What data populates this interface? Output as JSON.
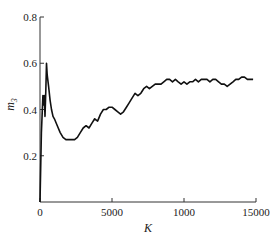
{
  "chart_data": {
    "type": "line",
    "title": "",
    "xlabel": "K",
    "ylabel": "m",
    "ylabel_subscript": "3",
    "xlim": [
      0,
      15000
    ],
    "ylim": [
      0,
      0.8
    ],
    "grid": false,
    "x_ticks": [
      0,
      5000,
      10000,
      15000
    ],
    "x_tick_labels": [
      "0",
      "5000",
      "1000",
      "15000"
    ],
    "y_ticks": [
      0.2,
      0.4,
      0.6,
      0.8
    ],
    "y_tick_labels": [
      "0.2",
      "0.4",
      "0.6",
      "0.8"
    ],
    "series": [
      {
        "name": "m3",
        "color": "#111111",
        "x": [
          0,
          100,
          200,
          250,
          300,
          350,
          400,
          450,
          500,
          600,
          700,
          800,
          900,
          1000,
          1200,
          1400,
          1600,
          1800,
          2000,
          2200,
          2400,
          2600,
          2800,
          3000,
          3200,
          3400,
          3600,
          3800,
          4000,
          4200,
          4400,
          4600,
          4800,
          5000,
          5200,
          5400,
          5600,
          5800,
          6000,
          6200,
          6400,
          6600,
          6800,
          7000,
          7200,
          7400,
          7600,
          7800,
          8000,
          8200,
          8400,
          8600,
          8800,
          9000,
          9200,
          9400,
          9600,
          9800,
          10000,
          10200,
          10400,
          10600,
          10800,
          11000,
          11200,
          11400,
          11600,
          11800,
          12000,
          12200,
          12400,
          12600,
          12800,
          13000,
          13200,
          13400,
          13600,
          13800,
          14000,
          14200,
          14400,
          14600,
          14800
        ],
        "y": [
          0.0,
          0.3,
          0.46,
          0.42,
          0.46,
          0.37,
          0.48,
          0.6,
          0.55,
          0.5,
          0.44,
          0.4,
          0.37,
          0.36,
          0.33,
          0.3,
          0.28,
          0.27,
          0.27,
          0.27,
          0.27,
          0.28,
          0.3,
          0.32,
          0.33,
          0.32,
          0.34,
          0.36,
          0.35,
          0.38,
          0.4,
          0.4,
          0.41,
          0.41,
          0.4,
          0.39,
          0.38,
          0.39,
          0.41,
          0.43,
          0.45,
          0.47,
          0.46,
          0.47,
          0.49,
          0.5,
          0.49,
          0.5,
          0.51,
          0.51,
          0.51,
          0.52,
          0.53,
          0.53,
          0.52,
          0.53,
          0.52,
          0.51,
          0.52,
          0.51,
          0.52,
          0.52,
          0.53,
          0.52,
          0.53,
          0.53,
          0.53,
          0.52,
          0.53,
          0.53,
          0.52,
          0.51,
          0.51,
          0.5,
          0.51,
          0.52,
          0.53,
          0.53,
          0.54,
          0.54,
          0.53,
          0.53,
          0.53
        ]
      }
    ]
  }
}
